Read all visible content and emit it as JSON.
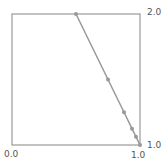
{
  "chart_data": {
    "type": "line",
    "title": "",
    "xlabel": "",
    "ylabel": "",
    "xlim": [
      0.0,
      1.0
    ],
    "ylim": [
      1.0,
      2.0
    ],
    "tick_labels": {
      "x_left": "0.0",
      "x_right": "1.0",
      "y_top": "2.0",
      "y_bottom": "1.0"
    },
    "series": [
      {
        "name": "curve",
        "color": "#999999",
        "x": [
          0.5,
          0.75,
          0.875,
          0.9375,
          0.96875,
          1.0
        ],
        "y": [
          2.0,
          1.5,
          1.25,
          1.125,
          1.0625,
          1.0
        ]
      }
    ],
    "grid": false,
    "legend": null
  }
}
